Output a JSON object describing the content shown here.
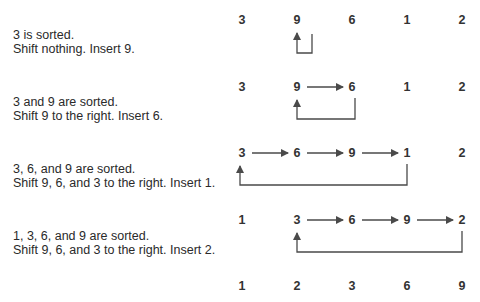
{
  "colors": {
    "text": "#2a2a2a",
    "numbers": "#333333",
    "arrows": "#4a4a4a",
    "background": "#ffffff"
  },
  "steps": [
    {
      "line1": "3 is sorted.",
      "line2": "Shift nothing. Insert 9.",
      "values": [
        "3",
        "9",
        "6",
        "1",
        "2"
      ]
    },
    {
      "line1": "3 and 9 are sorted.",
      "line2": "Shift 9 to the right. Insert 6.",
      "values": [
        "3",
        "9",
        "6",
        "1",
        "2"
      ]
    },
    {
      "line1": "3, 6, and 9 are sorted.",
      "line2": "Shift 9, 6, and 3 to the right. Insert 1.",
      "values": [
        "3",
        "6",
        "9",
        "1",
        "2"
      ]
    },
    {
      "line1": "1, 3, 6, and 9 are sorted.",
      "line2": "Shift 9, 6, and 3 to the right. Insert 2.",
      "values": [
        "1",
        "3",
        "6",
        "9",
        "2"
      ]
    }
  ],
  "result": {
    "values": [
      "1",
      "2",
      "3",
      "6",
      "9"
    ]
  }
}
